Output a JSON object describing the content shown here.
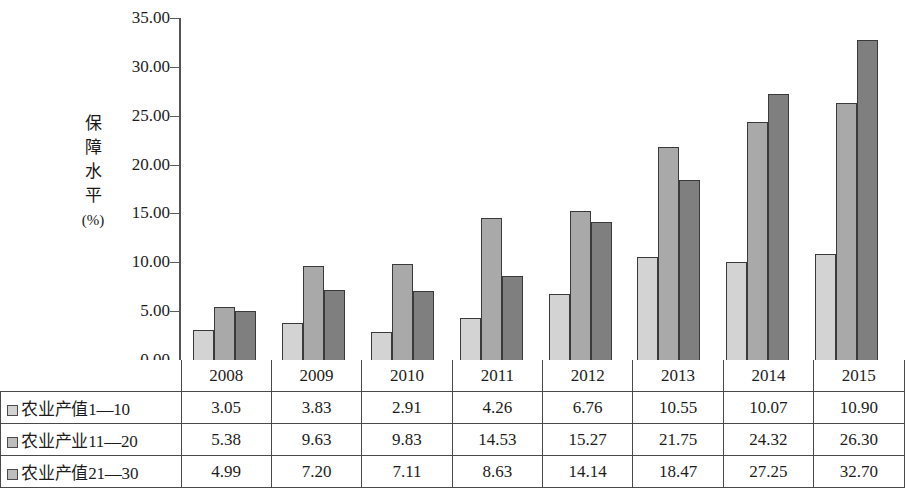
{
  "chart_data": {
    "type": "bar",
    "title": "",
    "xlabel": "",
    "ylabel": "保障水平(%)",
    "ylabel_chars": [
      "保",
      "障",
      "水",
      "平"
    ],
    "ylabel_unit": "(%)",
    "categories": [
      "2008",
      "2009",
      "2010",
      "2011",
      "2012",
      "2013",
      "2014",
      "2015"
    ],
    "series": [
      {
        "name": "农业产值1—10",
        "swatch": "legend-swatch-series-1",
        "color": "#d3d3d3",
        "values": [
          3.05,
          3.83,
          2.91,
          4.26,
          6.76,
          10.55,
          10.07,
          10.9
        ]
      },
      {
        "name": "农业产业11—20",
        "swatch": "legend-swatch-series-2",
        "color": "#a9a9a9",
        "values": [
          5.38,
          9.63,
          9.83,
          14.53,
          15.27,
          21.75,
          24.32,
          26.3
        ]
      },
      {
        "name": "农业产值21—30",
        "swatch": "legend-swatch-series-3",
        "color": "#7f7f7f",
        "values": [
          4.99,
          7.2,
          7.11,
          8.63,
          14.14,
          18.47,
          27.25,
          32.7
        ]
      }
    ],
    "ylim": [
      0,
      35
    ],
    "ytick_step": 5,
    "ytick_labels": [
      "35.00",
      "30.00",
      "25.00",
      "20.00",
      "15.00",
      "10.00",
      "5.00",
      "0.00"
    ],
    "ytick_values": [
      35,
      30,
      25,
      20,
      15,
      10,
      5,
      0
    ],
    "grid": false,
    "legend_position": "table-below"
  },
  "table": {
    "corner_label": "",
    "row_labels": [
      "农业产值1—10",
      "农业产业11—20",
      "农业产值21—30"
    ],
    "column_headers": [
      "2008",
      "2009",
      "2010",
      "2011",
      "2012",
      "2013",
      "2014",
      "2015"
    ],
    "rows": [
      [
        "3.05",
        "3.83",
        "2.91",
        "4.26",
        "6.76",
        "10.55",
        "10.07",
        "10.90"
      ],
      [
        "5.38",
        "9.63",
        "9.83",
        "14.53",
        "15.27",
        "21.75",
        "24.32",
        "26.30"
      ],
      [
        "4.99",
        "7.20",
        "7.11",
        "8.63",
        "14.14",
        "18.47",
        "27.25",
        "32.70"
      ]
    ]
  },
  "colors": {
    "series_1": "#d3d3d3",
    "series_2": "#a9a9a9",
    "series_3": "#7f7f7f",
    "outline": "#3a3a3a",
    "axis": "#555555",
    "text": "#1c1c1c",
    "background": "#ffffff"
  }
}
